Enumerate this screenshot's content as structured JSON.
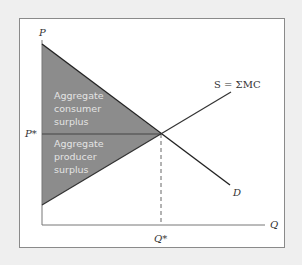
{
  "diagram": {
    "axes": {
      "y_label": "P",
      "x_label": "Q"
    },
    "equilibrium": {
      "price_label": "P*",
      "quantity_label": "Q*"
    },
    "curves": {
      "supply_label": "S = ΣMC",
      "demand_label": "D"
    },
    "regions": {
      "consumer_surplus": [
        "Aggregate",
        "consumer",
        "surplus"
      ],
      "producer_surplus": [
        "Aggregate",
        "producer",
        "surplus"
      ]
    },
    "colors": {
      "surplus_fill": "#8c8c8c",
      "line": "#222222",
      "frame": "#8a8a8a",
      "background": "#efefef"
    }
  }
}
